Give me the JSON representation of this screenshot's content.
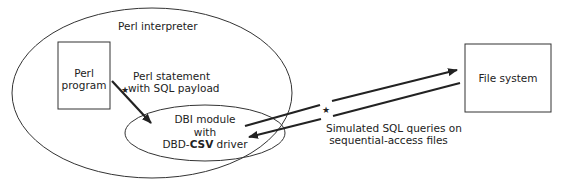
{
  "diagram": {
    "outer_container": {
      "label": "Perl interpreter"
    },
    "perl_program_box": {
      "line1": "Perl",
      "line2": "program"
    },
    "statement_label": {
      "line1": "Perl statement",
      "line2": "with SQL payload"
    },
    "dbi_module": {
      "line1": "DBI module",
      "line2": "with",
      "line3_prefix": "DBD-",
      "line3_bold": "CSV",
      "line3_suffix": " driver"
    },
    "file_system_box": {
      "label": "File system"
    },
    "queries_label": {
      "line1": "Simulated SQL queries on",
      "line2": "sequential-access files"
    },
    "markers": {
      "star": "★"
    },
    "colors": {
      "stroke": "#222222",
      "background": "#ffffff"
    }
  }
}
